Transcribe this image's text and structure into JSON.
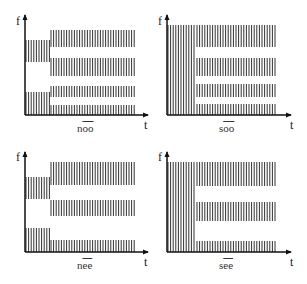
{
  "figure": {
    "axis_labels": {
      "y": "f",
      "x": "t"
    },
    "panels": [
      {
        "id": "noo",
        "prefix": "n",
        "vowel": "oo",
        "label": "nōō",
        "left_bands": [
          [
            40,
            62
          ],
          [
            92,
            115
          ]
        ],
        "right_bands": [
          [
            30,
            47
          ],
          [
            58,
            76
          ],
          [
            86,
            97
          ],
          [
            105,
            115
          ]
        ]
      },
      {
        "id": "soo",
        "prefix": "s",
        "vowel": "oo",
        "label": "sōō",
        "left_bands": [
          [
            25,
            115
          ]
        ],
        "right_bands": [
          [
            25,
            47
          ],
          [
            58,
            76
          ],
          [
            84,
            97
          ],
          [
            104,
            115
          ]
        ]
      },
      {
        "id": "nee",
        "prefix": "n",
        "vowel": "ee",
        "label": "nēē",
        "left_bands": [
          [
            35,
            57
          ],
          [
            86,
            110
          ]
        ],
        "right_bands": [
          [
            20,
            43
          ],
          [
            58,
            74
          ],
          [
            98,
            110
          ]
        ]
      },
      {
        "id": "see",
        "prefix": "s",
        "vowel": "ee",
        "label": "sēē",
        "left_bands": [
          [
            20,
            110
          ]
        ],
        "right_bands": [
          [
            20,
            44
          ],
          [
            60,
            79
          ],
          [
            99,
            110
          ]
        ]
      }
    ]
  }
}
